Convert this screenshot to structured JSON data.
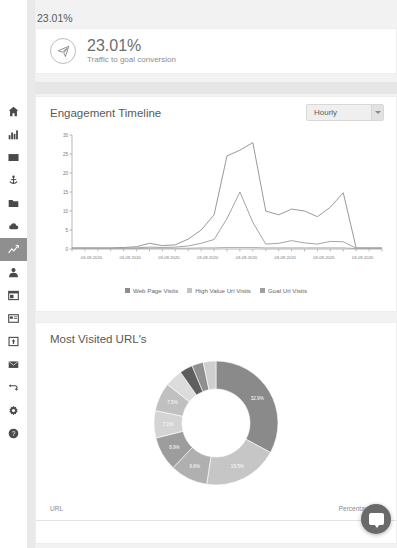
{
  "sidebar": {
    "items": [
      {
        "name": "home-icon",
        "label": "Home",
        "active": false
      },
      {
        "name": "bar-chart-icon",
        "label": "Analytics",
        "active": false
      },
      {
        "name": "envelope-icon",
        "label": "Mail",
        "active": false
      },
      {
        "name": "anchor-icon",
        "label": "Anchor",
        "active": false
      },
      {
        "name": "folder-icon",
        "label": "Files",
        "active": false
      },
      {
        "name": "cloud-icon",
        "label": "Cloud",
        "active": false
      },
      {
        "name": "trend-chart-icon",
        "label": "Engagement",
        "active": true
      },
      {
        "name": "user-icon",
        "label": "Contacts",
        "active": false
      },
      {
        "name": "window-icon",
        "label": "Pages",
        "active": false
      },
      {
        "name": "browser-icon",
        "label": "Browser",
        "active": false
      },
      {
        "name": "image-icon",
        "label": "Media",
        "active": false
      },
      {
        "name": "envelope-open-icon",
        "label": "Campaigns",
        "active": false
      },
      {
        "name": "refresh-icon",
        "label": "Sync",
        "active": false
      },
      {
        "name": "gear-icon",
        "label": "Settings",
        "active": false
      },
      {
        "name": "help-icon",
        "label": "Help",
        "active": false
      }
    ]
  },
  "page": {
    "top_value": "23.01%"
  },
  "kpi": {
    "value": "23.01%",
    "subtitle": "Traffic to goal conversion",
    "icon": "paper-plane-icon"
  },
  "engagement": {
    "title": "Engagement Timeline",
    "dropdown": {
      "selected": "Hourly",
      "options": [
        "Hourly",
        "Daily",
        "Weekly",
        "Monthly"
      ]
    }
  },
  "urls": {
    "title": "Most Visited URL's",
    "table": {
      "columns": [
        "URL",
        "Percentage"
      ]
    }
  },
  "chat": {
    "label": "chat-bubble"
  },
  "colors": {
    "series_web_page": "#8d8d8d",
    "series_high_value": "#9a9a9a",
    "series_goal": "#a8a8a8",
    "donut_primary": "#8a8a8a",
    "panel_bg": "#ffffff",
    "page_bg": "#f2f2f2",
    "active_nav": "#8f8f8f"
  },
  "chart_data": [
    {
      "type": "line",
      "title": "Engagement Timeline",
      "xlabel": "",
      "ylabel": "",
      "ylim": [
        0,
        30
      ],
      "yticks": [
        0,
        5,
        10,
        15,
        20,
        25,
        30
      ],
      "grid": false,
      "legend_position": "bottom",
      "x": [
        "03-09-2020",
        "03-09-2020",
        "03-09-2020",
        "03-09-2020",
        "03-09-2020",
        "03-09-2020",
        "03-09-2020",
        "03-09-2020",
        "03-09-2020",
        "03-09-2020",
        "03-09-2020",
        "03-09-2020",
        "03-09-2020",
        "03-09-2020",
        "03-09-2020",
        "03-09-2020",
        "03-09-2020",
        "03-09-2020",
        "03-09-2020",
        "03-09-2020",
        "03-09-2020",
        "03-09-2020",
        "03-09-2020",
        "03-09-2020",
        "03-09-2020"
      ],
      "xtick_labels": [
        "03-09-2020",
        "03-09-2020",
        "03-09-2020",
        "03-09-2020",
        "03-09-2020",
        "03-09-2020",
        "03-09-2020",
        "03-09-2020"
      ],
      "series": [
        {
          "name": "Web Page Visits",
          "color": "#8d8d8d",
          "values": [
            0.3,
            0.3,
            0.3,
            0.3,
            0.4,
            0.6,
            1.5,
            0.9,
            1.1,
            2.6,
            5.0,
            9.0,
            24.5,
            26.0,
            28.0,
            10.0,
            9.0,
            10.5,
            10.0,
            8.5,
            11.0,
            14.8,
            0.3,
            0.3,
            0.3
          ]
        },
        {
          "name": "High Value Url Visits",
          "color": "#9a9a9a",
          "values": [
            0.2,
            0.2,
            0.2,
            0.2,
            0.2,
            0.3,
            0.5,
            0.4,
            0.5,
            0.8,
            1.5,
            2.5,
            8.0,
            15.0,
            7.0,
            1.3,
            1.5,
            2.2,
            1.6,
            1.3,
            2.0,
            1.9,
            0.2,
            0.2,
            0.2
          ]
        },
        {
          "name": "Goal Url Visits",
          "color": "#a8a8a8",
          "values": [
            0.1,
            0.1,
            0.1,
            0.1,
            0.1,
            0.1,
            0.2,
            0.2,
            0.2,
            0.2,
            0.3,
            0.3,
            0.4,
            0.4,
            0.4,
            0.3,
            0.3,
            0.3,
            0.3,
            0.3,
            0.3,
            0.3,
            0.1,
            0.1,
            0.1
          ]
        }
      ]
    },
    {
      "type": "pie",
      "variant": "donut",
      "title": "Most Visited URL's",
      "labels": [
        "32.9%",
        "19.5%",
        "9.8%",
        "8.9%",
        "7.1%",
        "7.5%",
        "4.6%",
        "3.4%",
        "3.0%",
        "3.3%"
      ],
      "values": [
        32.9,
        19.5,
        9.8,
        8.9,
        7.1,
        7.5,
        4.6,
        3.4,
        3.0,
        3.3
      ],
      "colors": [
        "#8a8a8a",
        "#c6c6c6",
        "#b0b0b0",
        "#9d9d9d",
        "#d4d4d4",
        "#c0c0c0",
        "#dcdcdc",
        "#5e5e5e",
        "#8f8f8f",
        "#cfcfcf"
      ],
      "legend_position": "none"
    }
  ]
}
